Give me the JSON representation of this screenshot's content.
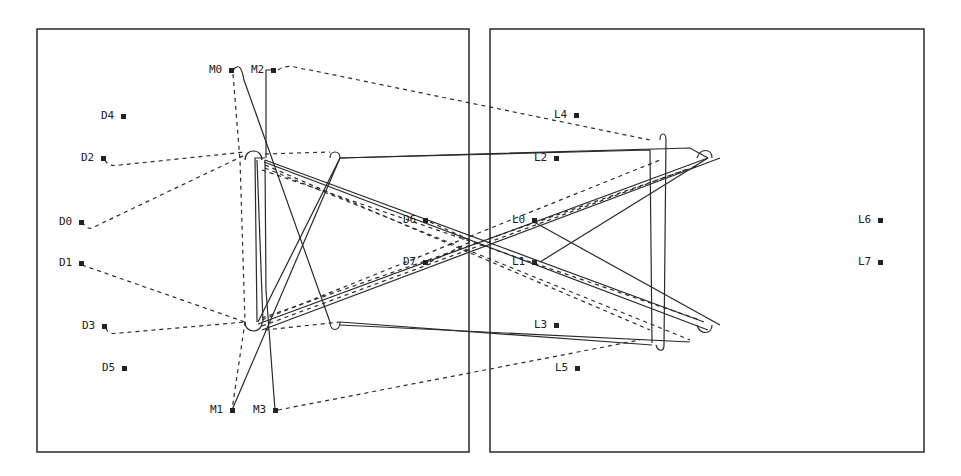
{
  "colors": {
    "stroke": "#2a2a2a",
    "background": "#ffffff"
  },
  "panels": [
    {
      "id": "left-panel",
      "x": 37,
      "y": 29,
      "w": 432,
      "h": 423
    },
    {
      "id": "right-panel",
      "x": 490,
      "y": 29,
      "w": 434,
      "h": 423
    }
  ],
  "pins": [
    {
      "label": "M0",
      "x": 231,
      "y": 70,
      "side": "left"
    },
    {
      "label": "M2",
      "x": 273,
      "y": 70,
      "side": "left"
    },
    {
      "label": "D4",
      "x": 123,
      "y": 116,
      "side": "left"
    },
    {
      "label": "D2",
      "x": 103,
      "y": 158,
      "side": "left"
    },
    {
      "label": "D0",
      "x": 81,
      "y": 222,
      "side": "left"
    },
    {
      "label": "D1",
      "x": 81,
      "y": 263,
      "side": "left"
    },
    {
      "label": "D3",
      "x": 104,
      "y": 326,
      "side": "left"
    },
    {
      "label": "D5",
      "x": 124,
      "y": 368,
      "side": "left"
    },
    {
      "label": "M1",
      "x": 232,
      "y": 410,
      "side": "left"
    },
    {
      "label": "M3",
      "x": 275,
      "y": 410,
      "side": "left"
    },
    {
      "label": "D6",
      "x": 425,
      "y": 220,
      "side": "left"
    },
    {
      "label": "D7",
      "x": 425,
      "y": 262,
      "side": "left"
    },
    {
      "label": "L4",
      "x": 576,
      "y": 115,
      "side": "left"
    },
    {
      "label": "L2",
      "x": 556,
      "y": 158,
      "side": "left"
    },
    {
      "label": "L0",
      "x": 534,
      "y": 220,
      "side": "left"
    },
    {
      "label": "L1",
      "x": 534,
      "y": 262,
      "side": "left"
    },
    {
      "label": "L3",
      "x": 556,
      "y": 325,
      "side": "left"
    },
    {
      "label": "L5",
      "x": 577,
      "y": 368,
      "side": "left"
    },
    {
      "label": "L6",
      "x": 880,
      "y": 220,
      "side": "left"
    },
    {
      "label": "L7",
      "x": 880,
      "y": 262,
      "side": "left"
    }
  ],
  "wires": {
    "solid": [
      "M 273 70 L 266 70 L 266 158",
      "M 233 70 C 240 62 242 70 244 80 L 330 322",
      "M 275 410 L 266 290 L 265 160",
      "M 232 410 L 340 158",
      "M 265 158 L 255 158 L 257 322",
      "M 257 160 L 263 322",
      "M 340 158 L 650 150 L 652 343",
      "M 340 158 L 690 148 L 708 158",
      "M 258 322 L 340 158",
      "M 265 160 L 704 322",
      "M 264 162 L 708 330",
      "M 258 324 L 708 158",
      "M 262 330 L 720 158",
      "M 340 322 L 652 345",
      "M 340 325 L 690 342",
      "M 534 222 L 720 325",
      "M 540 262 L 708 158",
      "M 660 140 C 660 132 666 132 666 140 L 664 345 C 664 352 658 352 656 345",
      "M 697 158 C 700 148 712 148 712 158",
      "M 697 325 C 700 335 712 335 712 325",
      "M 245 160 C 245 148 262 148 262 160",
      "M 245 322 C 245 334 262 334 262 322",
      "M 330 322 C 330 332 340 332 340 322",
      "M 330 158 C 330 150 340 150 340 158"
    ],
    "dashed": [
      "M 278 70 C 290 62 300 70 310 70 L 650 140",
      "M 233 74 L 240 160 L 245 322 L 232 410",
      "M 105 160 C 108 166 112 166 120 165 L 245 152",
      "M 82 222 C 86 228 90 230 94 227 L 245 155",
      "M 82 265 L 245 322",
      "M 106 328 C 108 334 112 334 120 333 L 245 322",
      "M 278 410 L 640 340",
      "M 265 165 L 650 330",
      "M 265 168 L 690 340",
      "M 262 320 L 660 160",
      "M 262 326 L 690 168",
      "M 262 170 L 700 320",
      "M 262 318 L 700 165",
      "M 265 330 L 340 322",
      "M 265 154 L 330 152",
      "M 430 222 L 470 240",
      "M 430 262 L 470 242"
    ]
  }
}
